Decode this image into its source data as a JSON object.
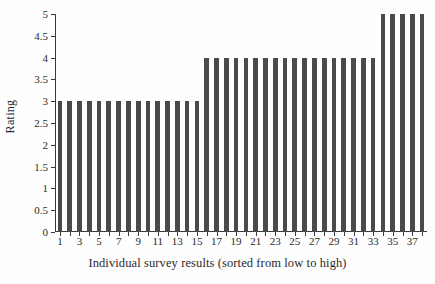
{
  "chart_data": {
    "type": "bar",
    "title": "",
    "xlabel": "Individual survey results (sorted from low to high)",
    "ylabel": "Rating",
    "categories": [
      1,
      2,
      3,
      4,
      5,
      6,
      7,
      8,
      9,
      10,
      11,
      12,
      13,
      14,
      15,
      16,
      17,
      18,
      19,
      20,
      21,
      22,
      23,
      24,
      25,
      26,
      27,
      28,
      29,
      30,
      31,
      32,
      33,
      34,
      35,
      36,
      37,
      38
    ],
    "values": [
      3,
      3,
      3,
      3,
      3,
      3,
      3,
      3,
      3,
      3,
      3,
      3,
      3,
      3,
      3,
      4,
      4,
      4,
      4,
      4,
      4,
      4,
      4,
      4,
      4,
      4,
      4,
      4,
      4,
      4,
      4,
      4,
      4,
      5,
      5,
      5,
      5,
      5
    ],
    "ylim": [
      0,
      5
    ],
    "xlim": [
      0.5,
      38.5
    ],
    "ytick_labels": [
      "0",
      "0.5",
      "1",
      "1.5",
      "2",
      "2.5",
      "3",
      "3.5",
      "4",
      "4.5",
      "5"
    ],
    "ytick_values": [
      0,
      0.5,
      1,
      1.5,
      2,
      2.5,
      3,
      3.5,
      4,
      4.5,
      5
    ],
    "xtick_values": [
      1,
      2,
      3,
      4,
      5,
      6,
      7,
      8,
      9,
      10,
      11,
      12,
      13,
      14,
      15,
      16,
      17,
      18,
      19,
      20,
      21,
      22,
      23,
      24,
      25,
      26,
      27,
      28,
      29,
      30,
      31,
      32,
      33,
      34,
      35,
      36,
      37,
      38
    ],
    "xtick_labels_shown": [
      1,
      3,
      5,
      7,
      9,
      11,
      13,
      15,
      17,
      19,
      21,
      23,
      25,
      27,
      29,
      31,
      33,
      35,
      37
    ],
    "grid": false,
    "legend": null,
    "bar_color": "#4a4a4a",
    "axis_color": "#3a3a3a",
    "background_color": "#fefefe"
  }
}
